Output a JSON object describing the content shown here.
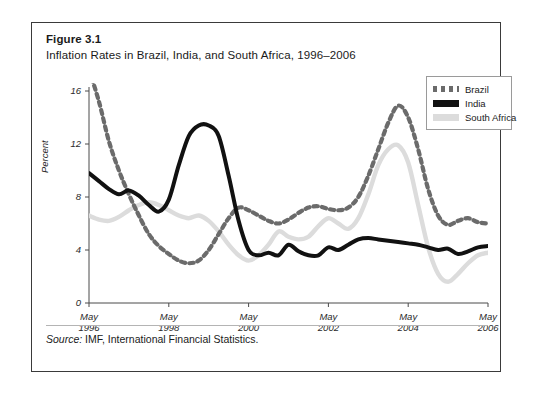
{
  "figure": {
    "label": "Figure 3.1",
    "title": "Inflation Rates in Brazil, India, and South Africa, 1996–2006",
    "source": "Source: IMF, International Financial Statistics.",
    "source_word": "Source:",
    "source_rest": " IMF, International Financial Statistics."
  },
  "legend": {
    "items": [
      {
        "label": "Brazil",
        "style": "dotted",
        "color": "#6b6b6b"
      },
      {
        "label": "India",
        "style": "solid",
        "color": "#111111"
      },
      {
        "label": "South Africa",
        "style": "solid",
        "color": "#dcdcdc"
      }
    ]
  },
  "colors": {
    "brazil": "#6b6b6b",
    "india": "#111111",
    "south_africa": "#dcdcdc",
    "axis": "#4a4a4a",
    "border": "#3a3a3a"
  },
  "chart_data": {
    "type": "line",
    "title": "Inflation Rates in Brazil, India, and South Africa, 1996–2006",
    "xlabel": "",
    "ylabel": "Percent",
    "ylim": [
      0,
      16
    ],
    "yticks": [
      0,
      4,
      8,
      12,
      16
    ],
    "ytick_labels": [
      "0",
      "4",
      "8",
      "12",
      "16"
    ],
    "xlim": [
      "May 1996",
      "May 2006"
    ],
    "xticks": [
      "May 1996",
      "May 1998",
      "May 2000",
      "May 2002",
      "May 2004",
      "May 2006"
    ],
    "xtick_labels": [
      {
        "line1": "May",
        "line2": "1996"
      },
      {
        "line1": "May",
        "line2": "1998"
      },
      {
        "line1": "May",
        "line2": "2000"
      },
      {
        "line1": "May",
        "line2": "2002"
      },
      {
        "line1": "May",
        "line2": "2004"
      },
      {
        "line1": "May",
        "line2": "2006"
      }
    ],
    "grid": false,
    "legend_position": "top-right",
    "x": [
      1996.37,
      1996.62,
      1996.87,
      1997.12,
      1997.37,
      1997.62,
      1997.87,
      1998.12,
      1998.37,
      1998.62,
      1998.87,
      1999.12,
      1999.37,
      1999.62,
      1999.87,
      2000.12,
      2000.37,
      2000.62,
      2000.87,
      2001.12,
      2001.37,
      2001.62,
      2001.87,
      2002.12,
      2002.37,
      2002.62,
      2002.87,
      2003.12,
      2003.37,
      2003.62,
      2003.87,
      2004.12,
      2004.37,
      2004.62,
      2004.87,
      2005.12,
      2005.37,
      2005.62,
      2005.87,
      2006.12,
      2006.37
    ],
    "series": [
      {
        "name": "Brazil",
        "style": "dotted",
        "color": "#6b6b6b",
        "values": [
          17.6,
          15.2,
          12.2,
          10.0,
          8.2,
          6.6,
          5.2,
          4.3,
          3.7,
          3.2,
          3.0,
          3.2,
          4.0,
          5.2,
          6.4,
          7.2,
          7.0,
          6.6,
          6.2,
          6.0,
          6.3,
          6.8,
          7.2,
          7.3,
          7.1,
          7.0,
          7.2,
          8.0,
          9.6,
          11.6,
          13.6,
          14.9,
          14.0,
          11.6,
          8.6,
          6.6,
          5.9,
          6.2,
          6.4,
          6.1,
          6.0
        ]
      },
      {
        "name": "India",
        "style": "solid",
        "color": "#111111",
        "values": [
          9.8,
          9.2,
          8.6,
          8.2,
          8.5,
          8.1,
          7.4,
          6.9,
          7.8,
          10.4,
          12.6,
          13.4,
          13.4,
          12.6,
          9.6,
          6.2,
          4.0,
          3.6,
          3.8,
          3.6,
          4.4,
          3.9,
          3.6,
          3.6,
          4.2,
          4.0,
          4.4,
          4.8,
          4.9,
          4.8,
          4.7,
          4.6,
          4.5,
          4.4,
          4.2,
          4.0,
          4.1,
          3.7,
          3.9,
          4.2,
          4.3
        ]
      },
      {
        "name": "South Africa",
        "style": "solid",
        "color": "#dcdcdc",
        "values": [
          6.6,
          6.3,
          6.2,
          6.5,
          7.0,
          7.4,
          7.6,
          7.4,
          7.0,
          6.6,
          6.4,
          6.6,
          6.2,
          5.4,
          4.4,
          3.6,
          3.2,
          3.6,
          4.4,
          5.4,
          5.0,
          4.8,
          5.0,
          5.8,
          6.4,
          6.0,
          5.6,
          6.4,
          8.2,
          10.4,
          11.6,
          11.9,
          10.6,
          7.4,
          4.2,
          2.2,
          1.6,
          2.2,
          3.0,
          3.6,
          3.8
        ]
      }
    ]
  }
}
